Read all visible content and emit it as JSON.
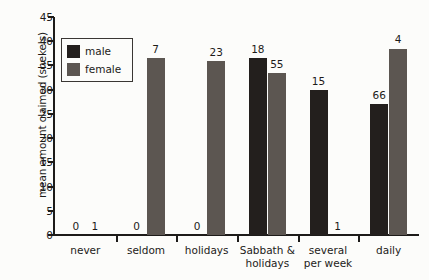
{
  "chart_data": {
    "type": "bar",
    "title": "",
    "subtitle": "",
    "xlabel": "",
    "ylabel": "mean amount claimed (shekels)",
    "ylim": [
      0,
      45
    ],
    "ytick_step": 5,
    "yticks": [
      0,
      5,
      10,
      15,
      20,
      25,
      30,
      35,
      40,
      45
    ],
    "grid": false,
    "legend_position": "inside-upper-left",
    "categories": [
      "never",
      "seldom",
      "holidays",
      "Sabbath & holidays",
      "several per week",
      "daily"
    ],
    "category_label_lines": [
      [
        "never"
      ],
      [
        "seldom"
      ],
      [
        "holidays"
      ],
      [
        "Sabbath &",
        "holidays"
      ],
      [
        "several",
        "per week"
      ],
      [
        "daily"
      ]
    ],
    "series": [
      {
        "name": "male",
        "color": "#231f1d",
        "values": [
          0,
          0,
          0,
          36.5,
          30,
          27
        ],
        "sample_sizes": [
          0,
          0,
          0,
          18,
          15,
          66
        ]
      },
      {
        "name": "female",
        "color": "#5c5651",
        "values": [
          0,
          36.5,
          36,
          33.5,
          0,
          38.5
        ],
        "sample_sizes": [
          1,
          7,
          23,
          55,
          1,
          4
        ]
      }
    ],
    "bar_value_annotations_are_sample_sizes": true
  },
  "legend": {
    "items": [
      {
        "label": "male",
        "color": "#231f1d"
      },
      {
        "label": "female",
        "color": "#5c5651"
      }
    ]
  },
  "axis": {
    "y_title": "mean amount claimed (shekels)"
  },
  "colors": {
    "male": "#231f1d",
    "female": "#5c5651",
    "axis": "#1d1b19",
    "background": "#fcfcfa"
  }
}
